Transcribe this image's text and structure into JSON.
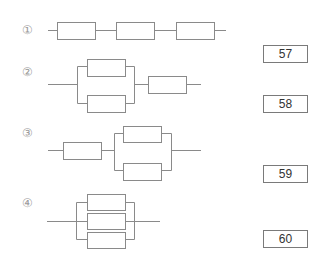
{
  "diagram": {
    "type": "reliability-block-diagrams",
    "items": [
      {
        "label": "①",
        "configuration": "series",
        "description": "three blocks in series"
      },
      {
        "label": "②",
        "configuration": "parallel-then-series",
        "description": "two blocks in parallel followed by one block in series"
      },
      {
        "label": "③",
        "configuration": "series-then-parallel",
        "description": "one block in series followed by two blocks in parallel"
      },
      {
        "label": "④",
        "configuration": "parallel",
        "description": "three blocks in parallel"
      }
    ]
  },
  "answer_boxes": [
    "57",
    "58",
    "59",
    "60"
  ],
  "colors": {
    "line": "#8a8a8a",
    "box_border": "#7a7a7a",
    "text": "#333333"
  }
}
